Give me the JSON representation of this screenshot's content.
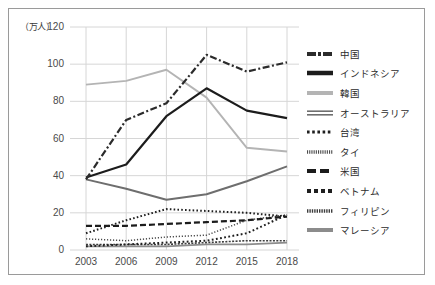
{
  "chart_data": {
    "type": "line",
    "title": "",
    "xlabel": "",
    "ylabel": "（万人）",
    "unit_label": "（万人）",
    "categories": [
      "2003",
      "2006",
      "2009",
      "2012",
      "2015",
      "2018"
    ],
    "x": [
      2003,
      2006,
      2009,
      2012,
      2015,
      2018
    ],
    "ylim": [
      0,
      120
    ],
    "yticks": [
      0,
      20,
      40,
      60,
      80,
      100,
      120
    ],
    "grid": true,
    "legend_position": "right",
    "series": [
      {
        "name": "中国",
        "key_style": "dash-dot-thick",
        "color": "#2b2b2b",
        "values": [
          38,
          70,
          79,
          105,
          96,
          101
        ]
      },
      {
        "name": "インドネシア",
        "key_style": "solid-thick",
        "color": "#1c1c1c",
        "values": [
          39,
          46,
          72,
          87,
          75,
          71
        ]
      },
      {
        "name": "韓国",
        "key_style": "solid-light",
        "color": "#b4b4b4",
        "values": [
          89,
          91,
          97,
          82,
          55,
          53
        ]
      },
      {
        "name": "オーストラリア",
        "key_style": "double-line",
        "color": "#6e6e6e",
        "values": [
          38,
          33,
          27,
          30,
          37,
          45
        ]
      },
      {
        "name": "台湾",
        "key_style": "dotted-coarse",
        "color": "#1f1f1f",
        "values": [
          9,
          16,
          22,
          21,
          20,
          18
        ]
      },
      {
        "name": "タイ",
        "key_style": "dotted-fine",
        "color": "#4a4a4a",
        "values": [
          6,
          5,
          7,
          8,
          16,
          19
        ]
      },
      {
        "name": "米国",
        "key_style": "dashed-thick",
        "color": "#1c1c1c",
        "values": [
          13,
          13,
          14,
          15,
          16,
          18
        ]
      },
      {
        "name": "ベトナム",
        "key_style": "dotted-round",
        "color": "#1f1f1f",
        "values": [
          2,
          3,
          4,
          5,
          9,
          19
        ]
      },
      {
        "name": "フィリピン",
        "key_style": "hatched",
        "color": "#3d3d3d",
        "values": [
          3,
          3,
          3,
          4,
          5,
          5
        ]
      },
      {
        "name": "マレーシア",
        "key_style": "solid-medium",
        "color": "#8c8c8c",
        "values": [
          2,
          2,
          2,
          3,
          3,
          4
        ]
      }
    ]
  }
}
